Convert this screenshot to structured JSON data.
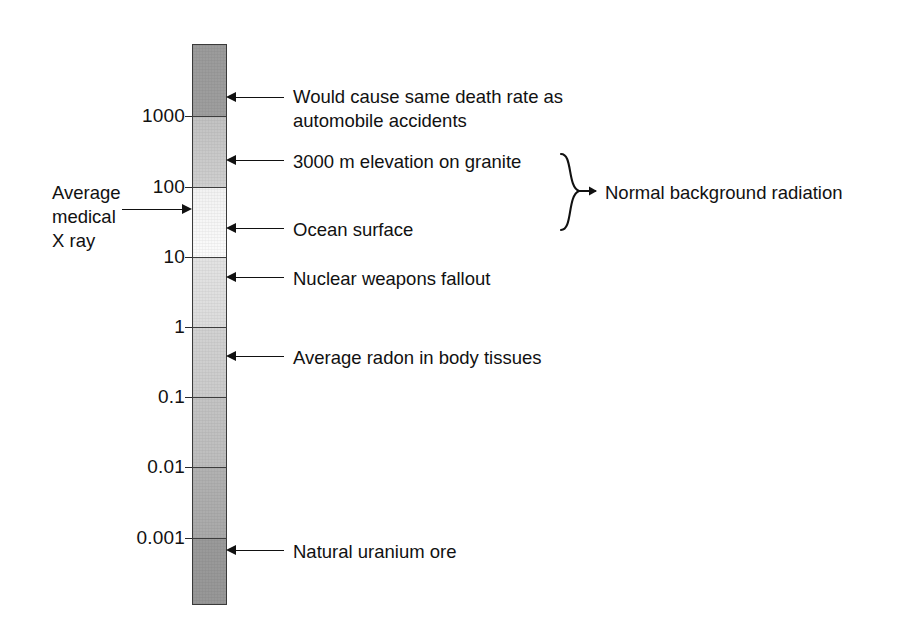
{
  "chart_data": {
    "type": "bar",
    "title": "",
    "subtitle": "",
    "xlabel": "",
    "ylabel": "",
    "scale": "log",
    "axis_ticks": [
      "1000",
      "100",
      "10",
      "1",
      "0.1",
      "0.01",
      "0.001"
    ],
    "axis_tick_values": [
      1000,
      100,
      10,
      1,
      0.1,
      0.01,
      0.001
    ],
    "ylim": [
      0.0001,
      10000
    ],
    "grid": false,
    "legend_position": "none",
    "bar_orientation": "vertical",
    "bar_description": "Single vertical logarithmic gradient bar, dark grey at top, lightest between 100 and 10, darkening again toward the bottom.",
    "segments": [
      {
        "range": "10000-1000",
        "shade": "#9b9b9b"
      },
      {
        "range": "1000-100",
        "shade": "#c9c9c9"
      },
      {
        "range": "100-10",
        "shade": "#f7f7f7"
      },
      {
        "range": "10-1",
        "shade": "#dfdfdf"
      },
      {
        "range": "1-0.1",
        "shade": "#cecece"
      },
      {
        "range": "0.1-0.01",
        "shade": "#c0c0c0"
      },
      {
        "range": "0.01-0.001",
        "shade": "#adadad"
      },
      {
        "range": "0.001-0.0001",
        "shade": "#989898"
      }
    ],
    "annotations": [
      {
        "label": "Would cause same death rate as\nautomobile accidents",
        "value": 3000,
        "side": "right"
      },
      {
        "label": "3000 m elevation on granite",
        "value": 300,
        "side": "right"
      },
      {
        "label": "Ocean surface",
        "value": 30,
        "side": "right"
      },
      {
        "label": "Nuclear weapons fallout",
        "value": 5,
        "side": "right"
      },
      {
        "label": "Average radon in body tissues",
        "value": 0.5,
        "side": "right"
      },
      {
        "label": "Natural uranium ore",
        "value": 0.0009,
        "side": "right"
      },
      {
        "label": "Average\nmedical\nX ray",
        "value": 55,
        "side": "left"
      }
    ],
    "brace_group": {
      "label": "Normal background radiation",
      "covers": [
        "3000 m elevation on granite",
        "Ocean surface"
      ]
    }
  },
  "axis": {
    "ticks": [
      {
        "label": "1000",
        "top": 116
      },
      {
        "label": "100",
        "top": 187
      },
      {
        "label": "10",
        "top": 257
      },
      {
        "label": "1",
        "top": 327
      },
      {
        "label": "0.1",
        "top": 397
      },
      {
        "label": "0.01",
        "top": 467
      },
      {
        "label": "0.001",
        "top": 538
      }
    ]
  },
  "callouts": {
    "right": [
      {
        "name": "death-rate-callout",
        "text": "Would cause same death rate as\nautomobile accidents",
        "arrow_top": 98,
        "text_top": 85
      },
      {
        "name": "granite-elevation-callout",
        "text": "3000 m elevation on granite",
        "arrow_top": 161,
        "text_top": 150
      },
      {
        "name": "ocean-surface-callout",
        "text": "Ocean surface",
        "arrow_top": 229,
        "text_top": 218
      },
      {
        "name": "fallout-callout",
        "text": "Nuclear weapons fallout",
        "arrow_top": 278,
        "text_top": 267
      },
      {
        "name": "radon-callout",
        "text": "Average radon in body tissues",
        "arrow_top": 357,
        "text_top": 346
      },
      {
        "name": "uranium-ore-callout",
        "text": "Natural uranium ore",
        "arrow_top": 551,
        "text_top": 540
      }
    ],
    "left": {
      "name": "medical-xray-callout",
      "text": "Average\nmedical\nX ray",
      "arrow_top": 204,
      "text_top": 181
    }
  },
  "brace": {
    "label": "Normal background radiation",
    "label_left": 605,
    "label_top": 181,
    "top": 152,
    "height": 80
  }
}
